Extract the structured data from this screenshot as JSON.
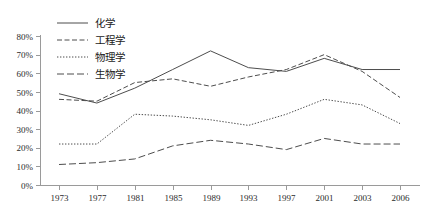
{
  "chart_data": {
    "type": "line",
    "title": "",
    "subtitle": "",
    "xlabel": "",
    "ylabel": "",
    "categories": [
      "1973",
      "1977",
      "1981",
      "1985",
      "1989",
      "1993",
      "1997",
      "2001",
      "2003",
      "2006"
    ],
    "ylim": [
      0,
      80
    ],
    "ytick_values": [
      0,
      10,
      20,
      30,
      40,
      50,
      60,
      70,
      80
    ],
    "ytick_labels": [
      "0%",
      "10%",
      "20%",
      "30%",
      "40%",
      "50%",
      "60%",
      "70%",
      "80%"
    ],
    "grid": false,
    "legend_position": "top-left-inside",
    "series": [
      {
        "name": "化学",
        "style": "solid",
        "color": "#4d4d4d",
        "values": [
          49,
          44,
          52,
          62,
          72,
          63,
          61,
          68,
          62,
          62
        ]
      },
      {
        "name": "工程学",
        "style": "dashed",
        "color": "#4d4d4d",
        "values": [
          46,
          45,
          55,
          57,
          53,
          58,
          62,
          70,
          61,
          47
        ]
      },
      {
        "name": "物理学",
        "style": "dotted",
        "color": "#4d4d4d",
        "values": [
          22,
          22,
          38,
          37,
          35,
          32,
          38,
          46,
          43,
          33
        ]
      },
      {
        "name": "生物学",
        "style": "longdash",
        "color": "#4d4d4d",
        "values": [
          11,
          12,
          14,
          21,
          24,
          22,
          19,
          25,
          22,
          22
        ]
      }
    ]
  },
  "legend": {
    "items": [
      {
        "label": "化学"
      },
      {
        "label": "工程学"
      },
      {
        "label": "物理学"
      },
      {
        "label": "生物学"
      }
    ]
  },
  "axes": {
    "y": {
      "labels": [
        "80%",
        "70%",
        "60%",
        "50%",
        "40%",
        "30%",
        "20%",
        "10%",
        "0%"
      ]
    },
    "x": {
      "labels": [
        "1973",
        "1977",
        "1981",
        "1985",
        "1989",
        "1993",
        "1997",
        "2001",
        "2003",
        "2006"
      ]
    }
  }
}
